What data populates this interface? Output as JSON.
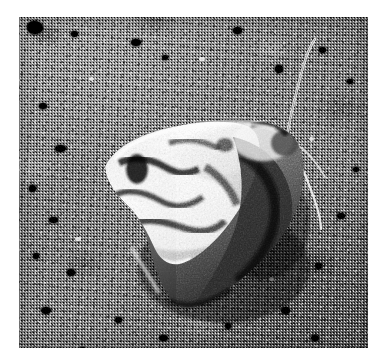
{
  "image": {
    "domain": "Natural-Image",
    "media_type": "photograph",
    "color_mode": "grayscale",
    "canvas": {
      "width": 384,
      "height": 362,
      "background_color": "#ffffff"
    },
    "plate": {
      "x": 19,
      "y": 17,
      "width": 349,
      "height": 331
    },
    "subject": {
      "name": "moth",
      "common_description": "camouflaged grey and white moth at rest with wings folded",
      "pose": "resting, wings folded in a triangular roof shape",
      "orientation": "head toward upper right, wing tip toward lower left",
      "parts": [
        {
          "label": "forewing",
          "tone": "mottled white, grey and black"
        },
        {
          "label": "thorax",
          "tone": "pale grey with dark crest"
        },
        {
          "label": "head",
          "tone": "dark grey"
        },
        {
          "label": "antenna-upper",
          "tone": "thin pale filament curving up and right"
        },
        {
          "label": "antenna-lower",
          "tone": "thin pale filament curving down and right"
        },
        {
          "label": "abdomen-tip",
          "tone": "dark grey, lower right"
        }
      ]
    },
    "background": {
      "name": "stone-substrate",
      "description": "coarse speckled concrete or weathered stone surface with dark pits",
      "tone_range": "dark grey to near white",
      "dominant_color": "#7d7d7d",
      "highlight_color": "#e9e9e9",
      "shadow_color": "#141414"
    },
    "palette": {
      "paper": "#ffffff",
      "mid_grey": "#7d7d7d",
      "light_grey": "#d6d6d6",
      "near_white": "#f2f2f2",
      "dark_grey": "#3a3a3a",
      "near_black": "#141414"
    },
    "caption": ""
  }
}
